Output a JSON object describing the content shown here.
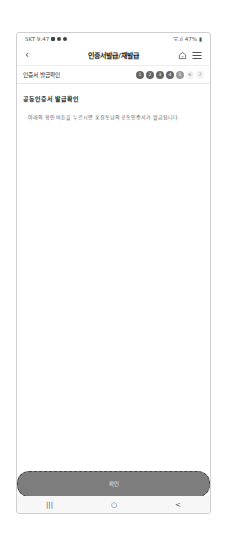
{
  "status_bar": {
    "carrier_time": "SKT 9:47",
    "battery": "47%"
  },
  "header": {
    "title": "인증서발급/재발급",
    "back_icon": "chevron-left-icon",
    "home_icon": "home-icon",
    "menu_icon": "hamburger-menu-icon"
  },
  "subheader": {
    "label": "인증서 발급확인",
    "steps": [
      {
        "n": "1",
        "state": "done"
      },
      {
        "n": "2",
        "state": "done"
      },
      {
        "n": "3",
        "state": "done"
      },
      {
        "n": "4",
        "state": "done"
      },
      {
        "n": "5",
        "state": "current"
      },
      {
        "n": "6",
        "state": "todo"
      },
      {
        "n": "7",
        "state": "todo"
      }
    ]
  },
  "content": {
    "heading": "공동인증서 발급확인",
    "description": "· 아래의 확인 버튼을 누르시면 홍길동님의 공동인증서가 발급됩니다."
  },
  "confirm_button": {
    "label": "확인"
  },
  "nav_bar": {
    "recent": "|||",
    "home": "○",
    "back": "<"
  }
}
